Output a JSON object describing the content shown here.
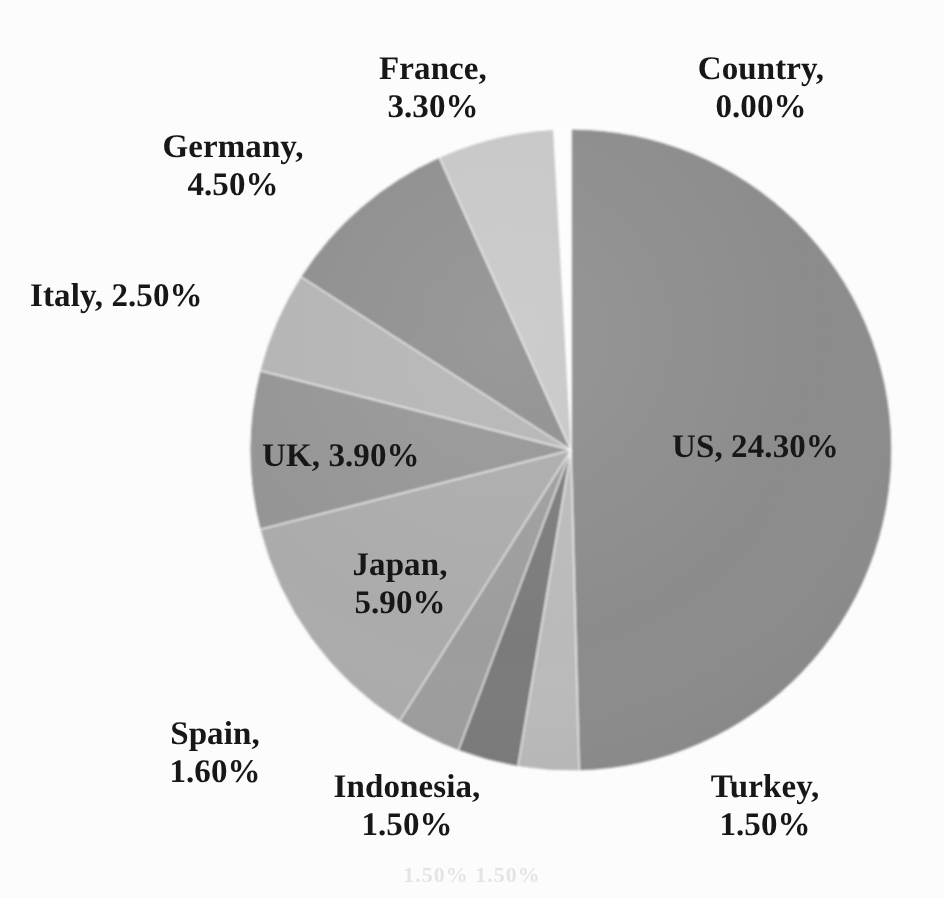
{
  "chart_data": {
    "type": "pie",
    "title": "",
    "subtitle": "",
    "xlabel": "",
    "ylabel": "",
    "legend_position": "none",
    "grid": false,
    "label_format": "name, percent",
    "start_angle_deg": 0,
    "direction": "clockwise",
    "units": "percent",
    "categories": [
      "Country",
      "US",
      "Turkey",
      "Indonesia",
      "Spain",
      "Japan",
      "UK",
      "Italy",
      "Germany",
      "France"
    ],
    "values": [
      0.0,
      24.3,
      1.5,
      1.5,
      1.6,
      5.9,
      3.9,
      2.5,
      4.5,
      3.3
    ],
    "slices": [
      {
        "name": "Country",
        "value": 0.0,
        "label": "Country,\n0.00%",
        "percent_text": "0.00%",
        "color": "#ffffff"
      },
      {
        "name": "US",
        "value": 24.3,
        "label": "US, 24.30%",
        "percent_text": "24.30%",
        "color": "#8d8d8d"
      },
      {
        "name": "Turkey",
        "value": 1.5,
        "label": "Turkey,\n1.50%",
        "percent_text": "1.50%",
        "color": "#bcbcbc"
      },
      {
        "name": "Indonesia",
        "value": 1.5,
        "label": "Indonesia,\n1.50%",
        "percent_text": "1.50%",
        "color": "#7b7b7b"
      },
      {
        "name": "Spain",
        "value": 1.6,
        "label": "Spain,\n1.60%",
        "percent_text": "1.60%",
        "color": "#9e9e9e"
      },
      {
        "name": "Japan",
        "value": 5.9,
        "label": "Japan,\n5.90%",
        "percent_text": "5.90%",
        "color": "#adadad"
      },
      {
        "name": "UK",
        "value": 3.9,
        "label": "UK, 3.90%",
        "percent_text": "3.90%",
        "color": "#969696"
      },
      {
        "name": "Italy",
        "value": 2.5,
        "label": "Italy, 2.50%",
        "percent_text": "2.50%",
        "color": "#b6b6b6"
      },
      {
        "name": "Germany",
        "value": 4.5,
        "label": "Germany,\n4.50%",
        "percent_text": "4.50%",
        "color": "#8f8f8f"
      },
      {
        "name": "France",
        "value": 3.3,
        "label": "France,\n3.30%",
        "percent_text": "3.30%",
        "color": "#c9c9c9"
      }
    ],
    "geometry": {
      "center_x": 571,
      "center_y": 450,
      "radius": 321,
      "explode_gap_deg": 3.2
    },
    "colors": {
      "background": "#ffffff",
      "label_text": "#17171a",
      "slice_outline": "#ffffff"
    }
  },
  "labels": {
    "country": "Country,\n0.00%",
    "us": "US, 24.30%",
    "turkey": "Turkey,\n1.50%",
    "indonesia": "Indonesia,\n1.50%",
    "spain": "Spain,\n1.60%",
    "japan": "Japan,\n5.90%",
    "uk": "UK, 3.90%",
    "italy": "Italy, 2.50%",
    "germany": "Germany,\n4.50%",
    "france": "France,\n3.30%"
  },
  "scan_ghost": "1.50%        1.50%"
}
